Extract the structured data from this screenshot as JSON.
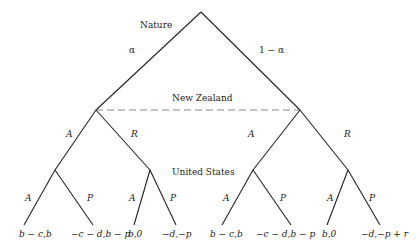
{
  "diagram": {
    "type": "game-tree",
    "players": {
      "root": "Nature",
      "second": "New Zealand",
      "third": "United States"
    },
    "nature_moves": [
      "α",
      "1 − α"
    ],
    "nz_moves": {
      "left": [
        "A",
        "R"
      ],
      "right": [
        "A",
        "R"
      ]
    },
    "us_moves": {
      "ll": [
        "A",
        "P"
      ],
      "lr": [
        "A",
        "P"
      ],
      "rl": [
        "A",
        "P"
      ],
      "rr": [
        "A",
        "P"
      ]
    },
    "payoffs": [
      "b − c,b",
      "−c − d,b − p",
      "b,0",
      "−d,−p",
      "b − c,b",
      "−c − d,b − p",
      "b,0",
      "−d,−p + r"
    ],
    "information_set": "dashed line connecting New Zealand nodes"
  }
}
